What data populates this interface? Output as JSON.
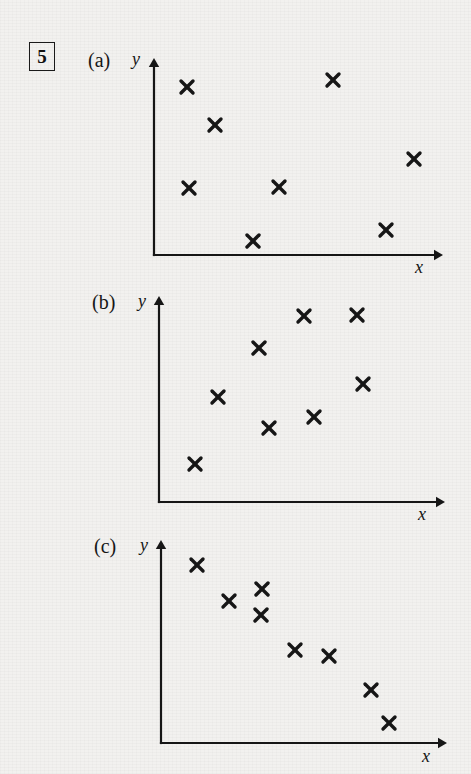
{
  "page": {
    "question_number": "5",
    "background_color": "#f2f1ef",
    "ink_color": "#161616",
    "width": 471,
    "height": 774
  },
  "panels": [
    {
      "label": "(a)",
      "label_pos": {
        "x": 88,
        "y": 50
      },
      "y_axis_label": "y",
      "y_label_pos": {
        "x": 132,
        "y": 50
      },
      "x_axis_label": "x",
      "x_label_pos": {
        "x": 415,
        "y": 258
      },
      "axes": {
        "origin_x": 154,
        "origin_y": 255,
        "top_y": 58,
        "right_x": 443
      }
    },
    {
      "label": "(b)",
      "label_pos": {
        "x": 92,
        "y": 292
      },
      "y_axis_label": "y",
      "y_label_pos": {
        "x": 138,
        "y": 292
      },
      "x_axis_label": "x",
      "x_label_pos": {
        "x": 418,
        "y": 505
      },
      "axes": {
        "origin_x": 159,
        "origin_y": 502,
        "top_y": 296,
        "right_x": 445
      }
    },
    {
      "label": "(c)",
      "label_pos": {
        "x": 94,
        "y": 536
      },
      "y_axis_label": "y",
      "y_label_pos": {
        "x": 140,
        "y": 536
      },
      "x_axis_label": "x",
      "x_label_pos": {
        "x": 422,
        "y": 747
      },
      "axes": {
        "origin_x": 161,
        "origin_y": 743,
        "top_y": 540,
        "right_x": 447
      }
    }
  ],
  "chart_data": [
    {
      "type": "scatter",
      "title": "(a)",
      "xlabel": "x",
      "ylabel": "y",
      "grid": false,
      "legend": "none",
      "marker": "x",
      "correlation": "no correlation",
      "n_points": 8,
      "axis_ranges": {
        "x": [
          0,
          10
        ],
        "y": [
          0,
          10
        ]
      },
      "points_px": [
        {
          "x": 187,
          "y": 87
        },
        {
          "x": 215,
          "y": 125
        },
        {
          "x": 333,
          "y": 80
        },
        {
          "x": 414,
          "y": 159
        },
        {
          "x": 189,
          "y": 188
        },
        {
          "x": 279,
          "y": 187
        },
        {
          "x": 386,
          "y": 230
        },
        {
          "x": 253,
          "y": 241
        }
      ],
      "points_data": [
        {
          "x": 1.1,
          "y": 8.5
        },
        {
          "x": 2.1,
          "y": 6.6
        },
        {
          "x": 6.2,
          "y": 8.9
        },
        {
          "x": 9.0,
          "y": 4.9
        },
        {
          "x": 1.2,
          "y": 3.4
        },
        {
          "x": 4.3,
          "y": 3.5
        },
        {
          "x": 8.0,
          "y": 1.3
        },
        {
          "x": 3.5,
          "y": 0.7
        }
      ]
    },
    {
      "type": "scatter",
      "title": "(b)",
      "xlabel": "x",
      "ylabel": "y",
      "grid": false,
      "legend": "none",
      "marker": "x",
      "correlation": "positive correlation",
      "n_points": 8,
      "axis_ranges": {
        "x": [
          0,
          10
        ],
        "y": [
          0,
          10
        ]
      },
      "points_px": [
        {
          "x": 304,
          "y": 316
        },
        {
          "x": 357,
          "y": 315
        },
        {
          "x": 259,
          "y": 348
        },
        {
          "x": 363,
          "y": 384
        },
        {
          "x": 218,
          "y": 397
        },
        {
          "x": 314,
          "y": 417
        },
        {
          "x": 269,
          "y": 428
        },
        {
          "x": 195,
          "y": 464
        }
      ],
      "points_data": [
        {
          "x": 5.1,
          "y": 9.0
        },
        {
          "x": 6.9,
          "y": 9.1
        },
        {
          "x": 3.5,
          "y": 7.5
        },
        {
          "x": 7.1,
          "y": 5.7
        },
        {
          "x": 2.1,
          "y": 5.1
        },
        {
          "x": 5.4,
          "y": 4.1
        },
        {
          "x": 3.8,
          "y": 3.6
        },
        {
          "x": 1.3,
          "y": 1.8
        }
      ]
    },
    {
      "type": "scatter",
      "title": "(c)",
      "xlabel": "x",
      "ylabel": "y",
      "grid": false,
      "legend": "none",
      "marker": "x",
      "correlation": "negative correlation",
      "n_points": 8,
      "axis_ranges": {
        "x": [
          0,
          10
        ],
        "y": [
          0,
          10
        ]
      },
      "points_px": [
        {
          "x": 197,
          "y": 565
        },
        {
          "x": 262,
          "y": 589
        },
        {
          "x": 229,
          "y": 601
        },
        {
          "x": 261,
          "y": 615
        },
        {
          "x": 295,
          "y": 650
        },
        {
          "x": 329,
          "y": 656
        },
        {
          "x": 371,
          "y": 690
        },
        {
          "x": 389,
          "y": 723
        }
      ],
      "points_data": [
        {
          "x": 1.3,
          "y": 8.8
        },
        {
          "x": 3.5,
          "y": 7.6
        },
        {
          "x": 2.4,
          "y": 7.0
        },
        {
          "x": 3.5,
          "y": 6.3
        },
        {
          "x": 4.7,
          "y": 4.6
        },
        {
          "x": 5.8,
          "y": 4.3
        },
        {
          "x": 7.3,
          "y": 2.6
        },
        {
          "x": 7.9,
          "y": 1.0
        }
      ]
    }
  ]
}
